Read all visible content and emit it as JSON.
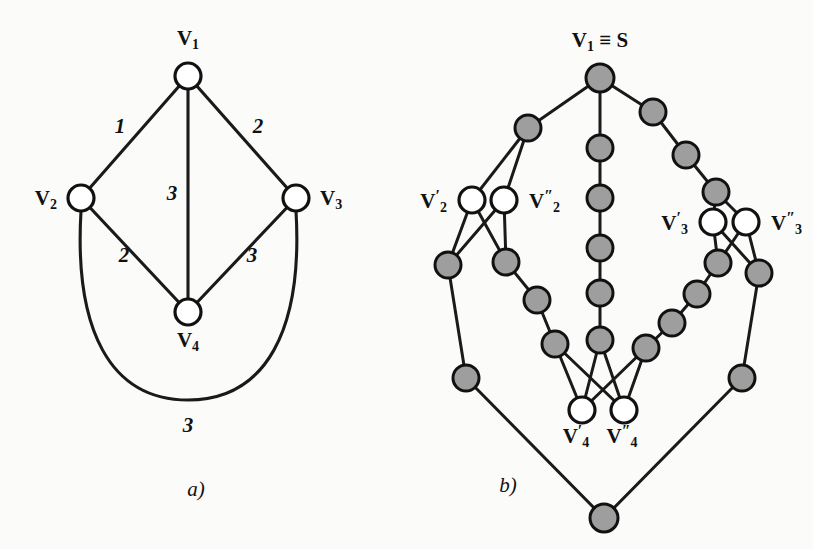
{
  "figure": {
    "title": "",
    "background_color": "#fbfbfa",
    "node_gray_color": "#9e9e9e",
    "node_open_color": "#ffffff",
    "stroke_color": "#111111"
  },
  "panel_a": {
    "caption": "a)",
    "caption_pos": {
      "x": 196,
      "y": 496
    },
    "nodes": [
      {
        "id": "v1",
        "cx": 188,
        "cy": 76,
        "r": 13,
        "style": "open",
        "label": "V",
        "sub": "1",
        "label_x": 188,
        "label_y": 45,
        "anchor": "middle"
      },
      {
        "id": "v2",
        "cx": 81,
        "cy": 198,
        "r": 13,
        "style": "open",
        "label": "V",
        "sub": "2",
        "label_x": 57,
        "label_y": 205,
        "anchor": "end"
      },
      {
        "id": "v3",
        "cx": 296,
        "cy": 198,
        "r": 13,
        "style": "open",
        "label": "V",
        "sub": "3",
        "label_x": 320,
        "label_y": 205,
        "anchor": "start"
      },
      {
        "id": "v4",
        "cx": 188,
        "cy": 312,
        "r": 13,
        "style": "open",
        "label": "V",
        "sub": "4",
        "label_x": 188,
        "label_y": 347,
        "anchor": "middle"
      }
    ],
    "edges": [
      {
        "from": "v1",
        "to": "v2",
        "weight": "1",
        "wx": 120,
        "wy": 133
      },
      {
        "from": "v1",
        "to": "v3",
        "weight": "2",
        "wx": 258,
        "wy": 133
      },
      {
        "from": "v1",
        "to": "v4",
        "weight": "3",
        "wx": 172,
        "wy": 200
      },
      {
        "from": "v2",
        "to": "v4",
        "weight": "2",
        "wx": 124,
        "wy": 262
      },
      {
        "from": "v3",
        "to": "v4",
        "weight": "3",
        "wx": 252,
        "wy": 262
      }
    ],
    "curved_edges": [
      {
        "from": "v2",
        "to": "v3",
        "weight": "3",
        "wx": 188,
        "wy": 432,
        "path": "M 81 211 C 74 330, 110 400, 188 400 C 266 400, 303 330, 296 211"
      }
    ]
  },
  "panel_b": {
    "caption": "b)",
    "caption_pos": {
      "x": 508,
      "y": 492
    },
    "top_label": {
      "main": "V",
      "sub": "1",
      "equiv": "≡",
      "second": "S",
      "x": 600,
      "y": 47
    },
    "named_nodes": [
      {
        "id": "s",
        "cx": 600,
        "cy": 78,
        "r": 14,
        "style": "gray"
      },
      {
        "id": "v2p",
        "cx": 472,
        "cy": 200,
        "r": 13,
        "style": "open",
        "label": "V",
        "sub": "2",
        "prime": "′",
        "label_x": 447,
        "label_y": 208,
        "anchor": "end"
      },
      {
        "id": "v2pp",
        "cx": 504,
        "cy": 200,
        "r": 13,
        "style": "open",
        "label": "V",
        "sub": "2",
        "prime": "″",
        "label_x": 529,
        "label_y": 208,
        "anchor": "start"
      },
      {
        "id": "v3p",
        "cx": 713,
        "cy": 222,
        "r": 13,
        "style": "open",
        "label": "V",
        "sub": "3",
        "prime": "′",
        "label_x": 688,
        "label_y": 230,
        "anchor": "end"
      },
      {
        "id": "v3pp",
        "cx": 746,
        "cy": 222,
        "r": 13,
        "style": "open",
        "label": "V",
        "sub": "3",
        "prime": "″",
        "label_x": 771,
        "label_y": 230,
        "anchor": "start"
      },
      {
        "id": "v4p",
        "cx": 582,
        "cy": 410,
        "r": 13,
        "style": "open",
        "label": "V",
        "sub": "4",
        "prime": "′",
        "label_x": 576,
        "label_y": 443,
        "anchor": "middle"
      },
      {
        "id": "v4pp",
        "cx": 624,
        "cy": 410,
        "r": 13,
        "style": "open",
        "label": "V",
        "sub": "4",
        "prime": "″",
        "label_x": 622,
        "label_y": 443,
        "anchor": "middle"
      }
    ],
    "gray_nodes": [
      {
        "id": "g_l1",
        "cx": 528,
        "cy": 128,
        "r": 13
      },
      {
        "id": "g_l2",
        "cx": 448,
        "cy": 265,
        "r": 13
      },
      {
        "id": "g_l3",
        "cx": 506,
        "cy": 262,
        "r": 13
      },
      {
        "id": "g_l4",
        "cx": 537,
        "cy": 300,
        "r": 13
      },
      {
        "id": "g_l5",
        "cx": 555,
        "cy": 344,
        "r": 13
      },
      {
        "id": "g_l6",
        "cx": 466,
        "cy": 378,
        "r": 13
      },
      {
        "id": "g_c1",
        "cx": 600,
        "cy": 148,
        "r": 13
      },
      {
        "id": "g_c2",
        "cx": 600,
        "cy": 198,
        "r": 13
      },
      {
        "id": "g_c3",
        "cx": 600,
        "cy": 248,
        "r": 13
      },
      {
        "id": "g_c4",
        "cx": 600,
        "cy": 293,
        "r": 13
      },
      {
        "id": "g_c5",
        "cx": 600,
        "cy": 340,
        "r": 13
      },
      {
        "id": "g_r1",
        "cx": 653,
        "cy": 112,
        "r": 13
      },
      {
        "id": "g_r2",
        "cx": 686,
        "cy": 155,
        "r": 13
      },
      {
        "id": "g_r3",
        "cx": 716,
        "cy": 192,
        "r": 13
      },
      {
        "id": "g_r4",
        "cx": 718,
        "cy": 263,
        "r": 13
      },
      {
        "id": "g_r5",
        "cx": 759,
        "cy": 273,
        "r": 13
      },
      {
        "id": "g_r6",
        "cx": 697,
        "cy": 294,
        "r": 13
      },
      {
        "id": "g_r7",
        "cx": 672,
        "cy": 323,
        "r": 13
      },
      {
        "id": "g_r8",
        "cx": 646,
        "cy": 348,
        "r": 13
      },
      {
        "id": "g_r9",
        "cx": 742,
        "cy": 378,
        "r": 13
      },
      {
        "id": "g_bot",
        "cx": 604,
        "cy": 518,
        "r": 14
      }
    ],
    "edges": [
      {
        "from": "s",
        "to": "g_l1"
      },
      {
        "from": "s",
        "to": "g_c1"
      },
      {
        "from": "s",
        "to": "g_r1"
      },
      {
        "from": "g_l1",
        "to": "v2p"
      },
      {
        "from": "g_l1",
        "to": "v2pp"
      },
      {
        "from": "v2p",
        "to": "g_l2"
      },
      {
        "from": "v2p",
        "to": "g_l3"
      },
      {
        "from": "v2pp",
        "to": "g_l2"
      },
      {
        "from": "v2pp",
        "to": "g_l3"
      },
      {
        "from": "g_l3",
        "to": "g_l4"
      },
      {
        "from": "g_l4",
        "to": "g_l5"
      },
      {
        "from": "g_l2",
        "to": "g_l6"
      },
      {
        "from": "g_l6",
        "to": "g_bot"
      },
      {
        "from": "g_c1",
        "to": "g_c2"
      },
      {
        "from": "g_c2",
        "to": "g_c3"
      },
      {
        "from": "g_c3",
        "to": "g_c4"
      },
      {
        "from": "g_c4",
        "to": "g_c5"
      },
      {
        "from": "g_r1",
        "to": "g_r2"
      },
      {
        "from": "g_r2",
        "to": "g_r3"
      },
      {
        "from": "g_r3",
        "to": "v3p"
      },
      {
        "from": "g_r3",
        "to": "v3pp"
      },
      {
        "from": "v3p",
        "to": "g_r4"
      },
      {
        "from": "v3p",
        "to": "g_r5"
      },
      {
        "from": "v3pp",
        "to": "g_r4"
      },
      {
        "from": "v3pp",
        "to": "g_r5"
      },
      {
        "from": "g_r4",
        "to": "g_r6"
      },
      {
        "from": "g_r6",
        "to": "g_r7"
      },
      {
        "from": "g_r7",
        "to": "g_r8"
      },
      {
        "from": "g_r5",
        "to": "g_r9"
      },
      {
        "from": "g_r9",
        "to": "g_bot"
      },
      {
        "from": "g_l5",
        "to": "v4p"
      },
      {
        "from": "g_l5",
        "to": "v4pp"
      },
      {
        "from": "g_c5",
        "to": "v4p"
      },
      {
        "from": "g_c5",
        "to": "v4pp"
      },
      {
        "from": "g_r8",
        "to": "v4p"
      },
      {
        "from": "g_r8",
        "to": "v4pp"
      }
    ]
  }
}
